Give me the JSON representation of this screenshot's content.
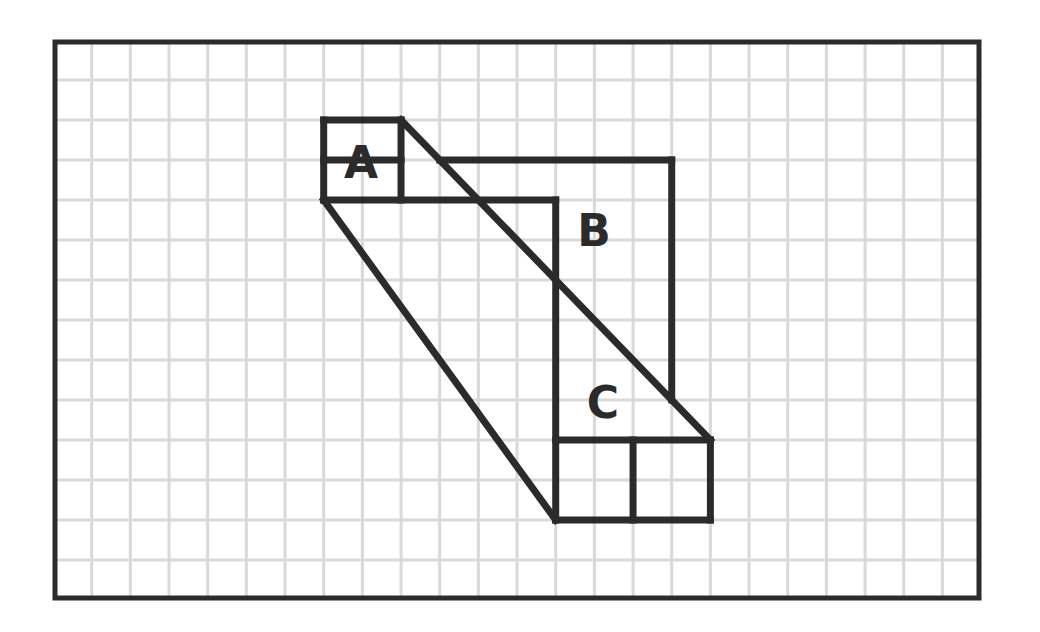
{
  "diagram": {
    "type": "grid-area-puzzle",
    "grid": {
      "columns": 24,
      "rows": 14,
      "origin": [
        53,
        40
      ],
      "cell_width": 38.67,
      "cell_height": 40,
      "line_color": "#d9d9d9"
    },
    "frame_color": "#2b2b2b",
    "stroke_color": "#2b2b2b",
    "labels": {
      "a": "A",
      "b": "B",
      "c": "C"
    },
    "shapes": {
      "A": {
        "description": "2x2 square split into two 2x1 halves, top-left region",
        "cells": {
          "col": [
            7,
            9
          ],
          "row": [
            2,
            4
          ]
        }
      },
      "B": {
        "description": "region bounded by top edge, right edge and main diagonal",
        "cells": {
          "col": [
            10,
            16
          ],
          "row": [
            3,
            9
          ]
        }
      },
      "C": {
        "description": "region above 4x2 rectangle split into two 2x2 squares",
        "cells": {
          "col": [
            13,
            17
          ],
          "row": [
            10,
            12
          ]
        }
      }
    },
    "segments_grid_units": [
      [
        [
          7,
          2
        ],
        [
          9,
          2
        ]
      ],
      [
        [
          7,
          2
        ],
        [
          7,
          4
        ]
      ],
      [
        [
          9,
          2
        ],
        [
          9,
          4
        ]
      ],
      [
        [
          7,
          3
        ],
        [
          9,
          3
        ]
      ],
      [
        [
          7,
          4
        ],
        [
          13,
          4
        ]
      ],
      [
        [
          9,
          2
        ],
        [
          17,
          10
        ]
      ],
      [
        [
          10,
          3
        ],
        [
          16,
          3
        ]
      ],
      [
        [
          16,
          3
        ],
        [
          16,
          9
        ]
      ],
      [
        [
          7,
          4
        ],
        [
          13,
          12
        ]
      ],
      [
        [
          13,
          4
        ],
        [
          13,
          12
        ]
      ],
      [
        [
          13,
          10
        ],
        [
          17,
          10
        ]
      ],
      [
        [
          17,
          10
        ],
        [
          17,
          12
        ]
      ],
      [
        [
          15,
          10
        ],
        [
          15,
          12
        ]
      ],
      [
        [
          13,
          12
        ],
        [
          17,
          12
        ]
      ]
    ]
  }
}
